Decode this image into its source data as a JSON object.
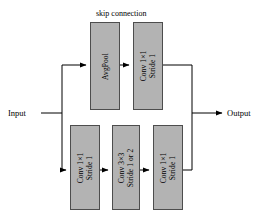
{
  "diagram": {
    "title": "skip connection",
    "input_label": "Input",
    "output_label": "Output",
    "blocks": {
      "avgpool": {
        "line1": "AvgPool",
        "line2": ""
      },
      "skip_conv": {
        "line1": "Conv 1×1",
        "line2": "Stride 1"
      },
      "main_conv1": {
        "line1": "Conv 1×1",
        "line2": "Stride 1"
      },
      "main_conv2": {
        "line1": "Conv 3×3",
        "line2": "Stride 1 or 2"
      },
      "main_conv3": {
        "line1": "Conv 1×1",
        "line2": "Stride 1"
      }
    },
    "colors": {
      "block_fill": "#b3b3b3",
      "block_stroke": "#4d4d4d",
      "line": "#000000",
      "background": "#ffffff"
    }
  }
}
